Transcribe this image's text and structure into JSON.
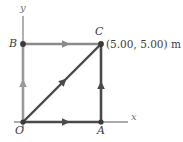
{
  "figure": {
    "type": "vector-path-diagram",
    "background_color": "#ffffff",
    "axes": {
      "x_label": "x",
      "y_label": "y",
      "axis_color": "#8f8f8f"
    },
    "vertices": [
      {
        "name": "O",
        "label": "O",
        "coord_x": 0.0,
        "coord_y": 0.0,
        "px": 23,
        "py": 122,
        "dot": false
      },
      {
        "name": "A",
        "label": "A",
        "coord_x": 5.0,
        "coord_y": 0.0,
        "px": 101,
        "py": 122,
        "dot": true
      },
      {
        "name": "B",
        "label": "B",
        "coord_x": 0.0,
        "coord_y": 5.0,
        "px": 23,
        "py": 44,
        "dot": true
      },
      {
        "name": "C",
        "label": "C",
        "coord_x": 5.0,
        "coord_y": 5.0,
        "px": 101,
        "py": 44,
        "dot": true
      }
    ],
    "annotation": {
      "point": "C",
      "text": "(5.00, 5.00) m"
    },
    "segments": [
      {
        "name": "segment-O-A",
        "from": "O",
        "to": "A",
        "color": "#4a4a4a",
        "arrow": "right"
      },
      {
        "name": "segment-A-C",
        "from": "A",
        "to": "C",
        "color": "#4a4a4a",
        "arrow": "up"
      },
      {
        "name": "segment-B-C",
        "from": "B",
        "to": "C",
        "color": "#8a8a8a",
        "arrow": "right"
      },
      {
        "name": "segment-O-B",
        "from": "O",
        "to": "B",
        "color": "#9a9a9a",
        "arrow": "up"
      },
      {
        "name": "segment-O-C",
        "from": "O",
        "to": "C",
        "color": "#4a4a4a",
        "arrow": "up-right"
      }
    ],
    "colors": {
      "dark_path": "#4a4a4a",
      "light_path": "#9a9a9a",
      "mid_path": "#8a8a8a",
      "axis": "#8f8f8f",
      "text": "#3d3d3d"
    }
  }
}
